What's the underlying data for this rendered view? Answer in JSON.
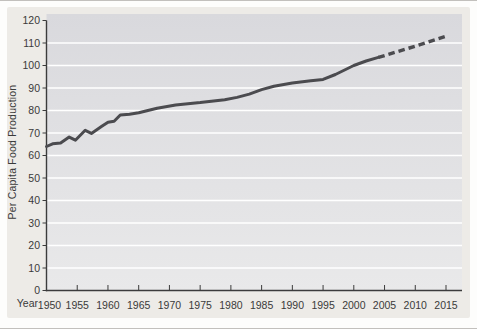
{
  "figure": {
    "y_axis_title": "Per Capita Food Production",
    "x_axis_label": "Year"
  },
  "chart_data": {
    "type": "line",
    "title": "",
    "xlabel": "Year",
    "ylabel": "Per Capita Food Production",
    "xlim": [
      1950,
      2015
    ],
    "ylim": [
      0,
      120
    ],
    "x_ticks": [
      1950,
      1955,
      1960,
      1965,
      1970,
      1975,
      1980,
      1985,
      1990,
      1995,
      2000,
      2005,
      2010,
      2015
    ],
    "y_ticks": [
      0,
      10,
      20,
      30,
      40,
      50,
      60,
      70,
      80,
      90,
      100,
      110,
      120
    ],
    "grid": {
      "horizontal": true,
      "vertical": false,
      "values": [
        10,
        20,
        30,
        40,
        50,
        60,
        70,
        80,
        90,
        100,
        110
      ]
    },
    "legend": "none",
    "series": [
      {
        "name": "per-capita-food-production-historical",
        "style": "solid",
        "color": "#4b4b4f",
        "points": [
          [
            1950,
            64
          ],
          [
            1951,
            65.2
          ],
          [
            1952.3,
            65.5
          ],
          [
            1953.7,
            68.2
          ],
          [
            1954.7,
            66.8
          ],
          [
            1956.3,
            71.2
          ],
          [
            1957.3,
            69.8
          ],
          [
            1959,
            73
          ],
          [
            1960,
            74.8
          ],
          [
            1961,
            75.2
          ],
          [
            1962,
            78
          ],
          [
            1963.5,
            78.3
          ],
          [
            1965,
            79
          ],
          [
            1968,
            81
          ],
          [
            1971,
            82.5
          ],
          [
            1975,
            83.5
          ],
          [
            1979,
            84.8
          ],
          [
            1981,
            85.8
          ],
          [
            1983,
            87.3
          ],
          [
            1985,
            89.3
          ],
          [
            1987,
            90.8
          ],
          [
            1990,
            92.2
          ],
          [
            1993,
            93.2
          ],
          [
            1995,
            93.8
          ],
          [
            1997,
            96
          ],
          [
            2000,
            100
          ],
          [
            2002,
            102
          ],
          [
            2004,
            103.6
          ]
        ]
      },
      {
        "name": "per-capita-food-production-projected",
        "style": "dashed",
        "color": "#4b4b4f",
        "points": [
          [
            2004,
            103.6
          ],
          [
            2010,
            108.6
          ],
          [
            2015,
            113
          ]
        ]
      }
    ],
    "colors": {
      "figure_background": "#edebe7",
      "plot_background_top": "#d9d9dd",
      "plot_background_bottom": "#e9e9ea",
      "gridline": "#ffffff",
      "axis": "#3c3c3c",
      "text": "#3a3a3a"
    }
  }
}
